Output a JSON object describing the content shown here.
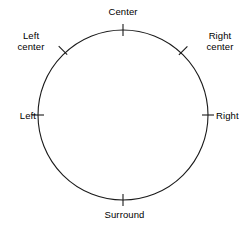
{
  "diagram": {
    "kind": "speaker-placement-circle",
    "background_color": "#ffffff",
    "stroke_color": "#000000",
    "text_color": "#000000",
    "circle": {
      "center_x": 123,
      "center_y": 115,
      "radius": 85,
      "stroke_width": 1
    },
    "positions": [
      {
        "id": "center",
        "label": "Center",
        "label_lines": [
          "Center"
        ],
        "angle_deg": 90,
        "tick": "radial"
      },
      {
        "id": "left-center",
        "label": "Left center",
        "label_lines": [
          "Left",
          "center"
        ],
        "angle_deg": 135,
        "tick": "radial"
      },
      {
        "id": "right-center",
        "label": "Right center",
        "label_lines": [
          "Right",
          "center"
        ],
        "angle_deg": 45,
        "tick": "radial"
      },
      {
        "id": "left",
        "label": "Left",
        "label_lines": [
          "Left"
        ],
        "angle_deg": 180,
        "tick": "radial"
      },
      {
        "id": "right",
        "label": "Right",
        "label_lines": [
          "Right"
        ],
        "angle_deg": 0,
        "tick": "radial"
      },
      {
        "id": "surround",
        "label": "Surround",
        "label_lines": [
          "Surround"
        ],
        "angle_deg": 270,
        "tick": "radial"
      }
    ]
  }
}
